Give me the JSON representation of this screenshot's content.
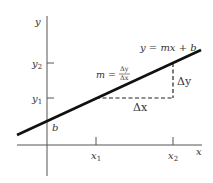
{
  "diagram": {
    "axes": {
      "x_label": "x",
      "y_label": "y"
    },
    "ticks": {
      "x1": "x",
      "x1_sub": "1",
      "x2": "x",
      "x2_sub": "2",
      "y1": "y",
      "y1_sub": "1",
      "y2": "y",
      "y2_sub": "2"
    },
    "intercept_label": "b",
    "line_equation": "y = mx + b",
    "slope_formula": {
      "lhs": "m =",
      "numerator": "Δy",
      "denominator": "Δx"
    },
    "delta_x_label": "Δx",
    "delta_y_label": "Δy",
    "colors": {
      "line": "#111111",
      "axes": "#555555",
      "text": "#333333"
    }
  }
}
